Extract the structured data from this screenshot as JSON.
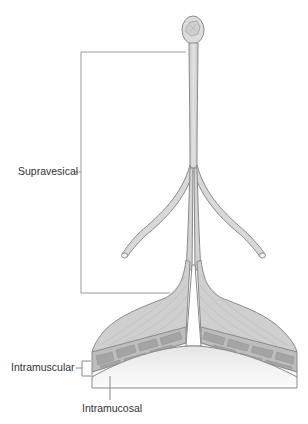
{
  "figure": {
    "labels": {
      "supravesical": "Supravesical",
      "intramuscular": "Intramuscular",
      "intramucosal": "Intramucosal"
    },
    "colors": {
      "outline": "#8a8a8a",
      "tissue_fill": "#d6d6d6",
      "muscle_fill": "#c4c4c4",
      "muscle_block": "#a8a8a8",
      "mucosa_fill": "#ececec",
      "leader_line": "#9a9a9a",
      "label_text": "#333333"
    }
  }
}
